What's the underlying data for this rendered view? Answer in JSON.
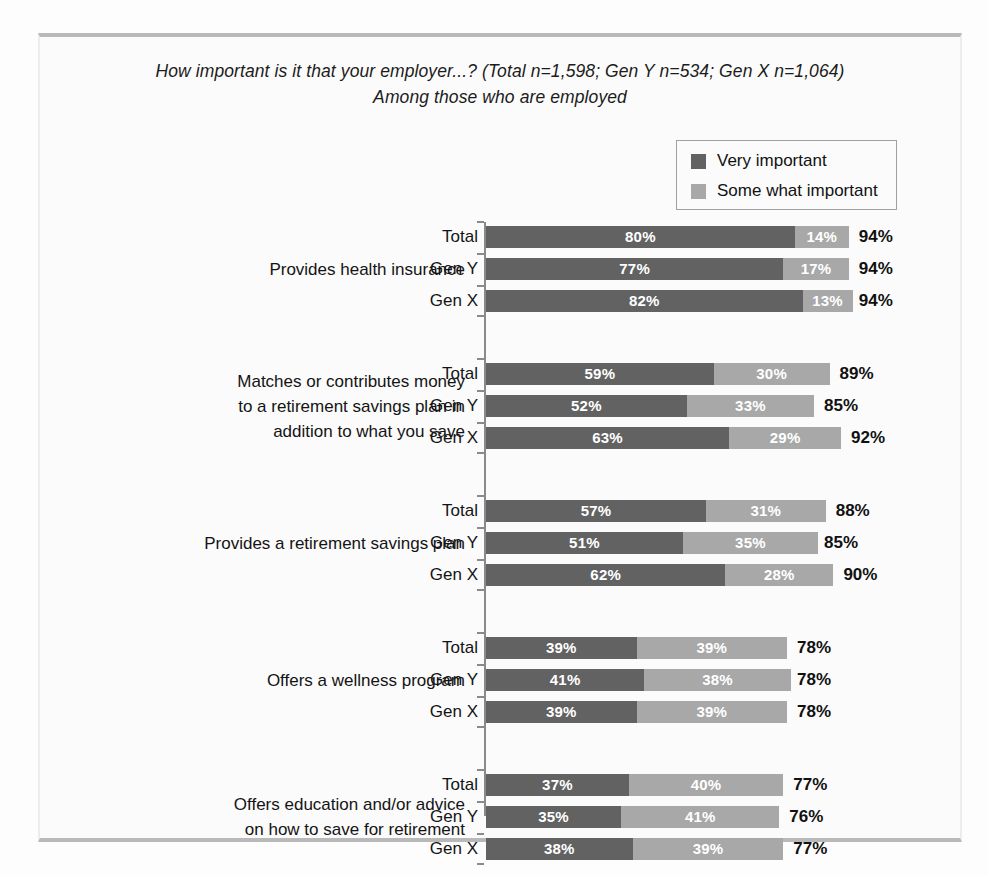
{
  "frame": {
    "border_color": "#b9b9b9",
    "background": "#fbfbfb"
  },
  "title": {
    "line1": "How important is it that your employer...?  (Total n=1,598; Gen Y n=534; Gen X n=1,064)",
    "line2": "Among those who are employed"
  },
  "legend": {
    "items": [
      {
        "label": "Very important",
        "color": "#626262",
        "swatch_name": "legend-swatch-very-important"
      },
      {
        "label": "Some what important",
        "color": "#a8a8a8",
        "swatch_name": "legend-swatch-some-what-important"
      }
    ]
  },
  "chart_data": {
    "type": "bar",
    "orientation": "horizontal",
    "stacked": true,
    "title": "How important is it that your employer...?  (Total n=1,598; Gen Y n=534; Gen X n=1,064)",
    "subtitle": "Among those who are employed",
    "xlabel": "",
    "ylabel": "",
    "xlim": [
      0,
      100
    ],
    "grid": false,
    "legend_position": "top-right",
    "value_suffix": "%",
    "series_names": [
      "Very important",
      "Some what important"
    ],
    "series_colors": [
      "#626262",
      "#a8a8a8"
    ],
    "groups": [
      {
        "category": "Provides health insurance",
        "rows": [
          {
            "label": "Total",
            "very": 80,
            "some": 14,
            "total": 94,
            "very_text": "80%",
            "some_text": "14%",
            "total_text": "94%"
          },
          {
            "label": "Gen Y",
            "very": 77,
            "some": 17,
            "total": 94,
            "very_text": "77%",
            "some_text": "17%",
            "total_text": "94%"
          },
          {
            "label": "Gen X",
            "very": 82,
            "some": 13,
            "total": 94,
            "very_text": "82%",
            "some_text": "13%",
            "total_text": "94%"
          }
        ]
      },
      {
        "category": "Matches or contributes money to a retirement savings plan in addition to what you save",
        "category_lines": [
          "Matches or contributes money",
          "to a retirement savings plan in",
          "addition to what you save"
        ],
        "rows": [
          {
            "label": "Total",
            "very": 59,
            "some": 30,
            "total": 89,
            "very_text": "59%",
            "some_text": "30%",
            "total_text": "89%"
          },
          {
            "label": "Gen Y",
            "very": 52,
            "some": 33,
            "total": 85,
            "very_text": "52%",
            "some_text": "33%",
            "total_text": "85%"
          },
          {
            "label": "Gen X",
            "very": 63,
            "some": 29,
            "total": 92,
            "very_text": "63%",
            "some_text": "29%",
            "total_text": "92%"
          }
        ]
      },
      {
        "category": "Provides a retirement savings plan",
        "rows": [
          {
            "label": "Total",
            "very": 57,
            "some": 31,
            "total": 88,
            "very_text": "57%",
            "some_text": "31%",
            "total_text": "88%"
          },
          {
            "label": "Gen Y",
            "very": 51,
            "some": 35,
            "total": 85,
            "very_text": "51%",
            "some_text": "35%",
            "total_text": "85%"
          },
          {
            "label": "Gen X",
            "very": 62,
            "some": 28,
            "total": 90,
            "very_text": "62%",
            "some_text": "28%",
            "total_text": "90%"
          }
        ]
      },
      {
        "category": "Offers a wellness program",
        "rows": [
          {
            "label": "Total",
            "very": 39,
            "some": 39,
            "total": 78,
            "very_text": "39%",
            "some_text": "39%",
            "total_text": "78%"
          },
          {
            "label": "Gen Y",
            "very": 41,
            "some": 38,
            "total": 78,
            "very_text": "41%",
            "some_text": "38%",
            "total_text": "78%"
          },
          {
            "label": "Gen X",
            "very": 39,
            "some": 39,
            "total": 78,
            "very_text": "39%",
            "some_text": "39%",
            "total_text": "78%"
          }
        ]
      },
      {
        "category": "Offers education and/or advice on how to save for retirement",
        "category_lines": [
          "Offers education and/or advice",
          "on how to save for retirement"
        ],
        "rows": [
          {
            "label": "Total",
            "very": 37,
            "some": 40,
            "total": 77,
            "very_text": "37%",
            "some_text": "40%",
            "total_text": "77%"
          },
          {
            "label": "Gen Y",
            "very": 35,
            "some": 41,
            "total": 76,
            "very_text": "35%",
            "some_text": "41%",
            "total_text": "76%"
          },
          {
            "label": "Gen X",
            "very": 38,
            "some": 39,
            "total": 77,
            "very_text": "38%",
            "some_text": "39%",
            "total_text": "77%"
          }
        ]
      }
    ]
  }
}
